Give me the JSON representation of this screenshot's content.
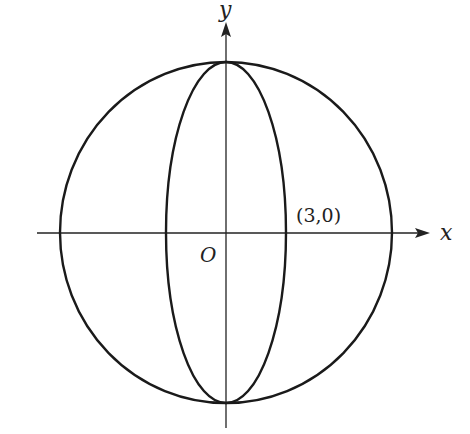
{
  "diagram": {
    "axes": {
      "x_label": "x",
      "y_label": "y",
      "origin_label": "O"
    },
    "point_label": "(3,0)",
    "shapes": [
      {
        "type": "circle",
        "name": "outer-circle"
      },
      {
        "type": "ellipse",
        "name": "inner-ellipse",
        "orientation": "vertical"
      }
    ],
    "colors": {
      "stroke": "#1a1a1a",
      "background": "#ffffff"
    }
  }
}
